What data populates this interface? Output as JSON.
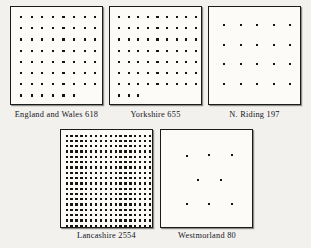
{
  "figure": {
    "type": "dot-density-plot-group",
    "background_color": "#f2f1ee",
    "box_fill_color": "#fcfbf8",
    "box_border_color": "#1b1b1b",
    "dot_color": "#141414",
    "panels": [
      {
        "id": "england-and-wales",
        "region_name": "England and Wales",
        "value": "618",
        "caption": "England and Wales 618",
        "box": {
          "x": 10,
          "y": 6,
          "w": 93,
          "h": 99
        },
        "caption_x": 4,
        "caption_y": 110,
        "caption_w": 105,
        "dots": {
          "columns": 8,
          "rows": 8,
          "last_row_count": 6,
          "total": 62,
          "dot_size": 2.2,
          "pad_x": 9,
          "pad_y": 9,
          "step_x": 10.6,
          "step_y": 11.2
        }
      },
      {
        "id": "yorkshire",
        "region_name": "Yorkshire",
        "value": "655",
        "caption": "Yorkshire 655",
        "box": {
          "x": 109,
          "y": 6,
          "w": 93,
          "h": 99
        },
        "caption_x": 109,
        "caption_y": 110,
        "caption_w": 93,
        "dots": {
          "columns": 9,
          "rows": 8,
          "last_row_count": 3,
          "total": 66,
          "dot_size": 2.2,
          "pad_x": 8,
          "pad_y": 9,
          "step_x": 9.6,
          "step_y": 11.2
        }
      },
      {
        "id": "n-riding",
        "region_name": "N. Riding",
        "value": "197",
        "caption": "N. Riding 197",
        "box": {
          "x": 208,
          "y": 6,
          "w": 93,
          "h": 99
        },
        "caption_x": 208,
        "caption_y": 110,
        "caption_w": 93,
        "dots": {
          "columns": 5,
          "rows": 4,
          "last_row_count": 5,
          "total": 20,
          "dot_size": 2.2,
          "pad_x": 14,
          "pad_y": 17,
          "step_x": 16.5,
          "step_y": 19.5
        }
      },
      {
        "id": "lancashire",
        "region_name": "Lancashire",
        "value": "2554",
        "caption": "Lancashire 2554",
        "box": {
          "x": 60,
          "y": 129,
          "w": 93,
          "h": 99
        },
        "caption_x": 60,
        "caption_y": 231,
        "caption_w": 93,
        "dots": {
          "columns": 18,
          "rows": 18,
          "last_row_count": 18,
          "total": 324,
          "dot_size": 2.4,
          "pad_x": 4.5,
          "pad_y": 4.5,
          "step_x": 4.9,
          "step_y": 5.3
        }
      },
      {
        "id": "westmorland",
        "region_name": "Westmorland",
        "value": "80",
        "caption": "Westmorland 80",
        "box": {
          "x": 160,
          "y": 129,
          "w": 93,
          "h": 99
        },
        "caption_x": 158,
        "caption_y": 231,
        "caption_w": 98,
        "scatter_dots": [
          {
            "x": 25,
            "y": 25
          },
          {
            "x": 47,
            "y": 24
          },
          {
            "x": 70,
            "y": 24
          },
          {
            "x": 36,
            "y": 49
          },
          {
            "x": 59,
            "y": 49
          },
          {
            "x": 25,
            "y": 73
          },
          {
            "x": 47,
            "y": 73
          },
          {
            "x": 70,
            "y": 73
          }
        ],
        "dot_size": 2.2,
        "total": 8
      }
    ]
  },
  "chart_data": {
    "type": "scatter",
    "title": "",
    "xlabel": "",
    "ylabel": "",
    "categories": [
      "England and Wales",
      "Yorkshire",
      "N. Riding",
      "Lancashire",
      "Westmorland"
    ],
    "values": [
      618,
      655,
      197,
      2554,
      80
    ],
    "dots_drawn": [
      62,
      66,
      20,
      324,
      8
    ],
    "grid": false,
    "legend": "none"
  }
}
